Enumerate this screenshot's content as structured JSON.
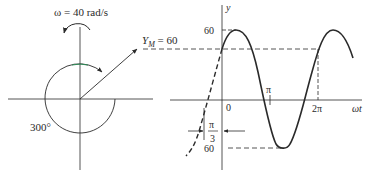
{
  "phasor": {
    "omega_label": "ω = 40 rad/s",
    "amplitude_label_main": "Y",
    "amplitude_label_sub": "M",
    "amplitude_label_rest": " = 60",
    "angle_label": "300°"
  },
  "graph": {
    "y_axis_label": "y",
    "x_axis_label": "ωt",
    "tick_top": "60",
    "tick_bottom": "60",
    "tick_zero": "0",
    "tick_pi": "π",
    "tick_2pi": "2π",
    "phase_numerator": "π",
    "phase_denominator": "3"
  },
  "colors": {
    "line": "#2a2a2a",
    "arc_accent": "#2e8b57"
  }
}
